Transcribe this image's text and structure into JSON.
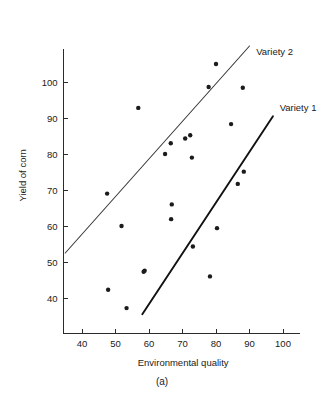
{
  "figure": {
    "panel_label": "(a)",
    "width": 325,
    "height": 397
  },
  "chart_data": {
    "type": "scatter",
    "title": "",
    "subtitle": "",
    "xlabel": "Environmental quality",
    "ylabel": "Yield of corn",
    "xlim": [
      34,
      104
    ],
    "ylim": [
      32,
      108
    ],
    "xticks": [
      40,
      50,
      60,
      70,
      80,
      90,
      100
    ],
    "xticklabels": [
      "40",
      "50",
      "60",
      "70",
      "80",
      "90",
      "100"
    ],
    "yticks": [
      40,
      50,
      60,
      70,
      80,
      90,
      100
    ],
    "yticklabels": [
      "40",
      "50",
      "60",
      "70",
      "80",
      "90",
      "100"
    ],
    "grid": false,
    "legend_position": "inline-right-of-lines",
    "annotations": [
      {
        "text": "Variety 2",
        "x": 92,
        "y": 107.5
      },
      {
        "text": "Variety 1",
        "x": 99,
        "y": 92.0
      }
    ],
    "points": [
      {
        "x": 47.5,
        "y": 69.0
      },
      {
        "x": 47.8,
        "y": 42.3
      },
      {
        "x": 51.8,
        "y": 60.0
      },
      {
        "x": 53.3,
        "y": 37.2
      },
      {
        "x": 56.8,
        "y": 92.8
      },
      {
        "x": 58.4,
        "y": 47.3
      },
      {
        "x": 58.7,
        "y": 47.6
      },
      {
        "x": 64.8,
        "y": 80.0
      },
      {
        "x": 66.5,
        "y": 83.0
      },
      {
        "x": 66.6,
        "y": 61.9
      },
      {
        "x": 66.8,
        "y": 66.0
      },
      {
        "x": 70.8,
        "y": 84.3
      },
      {
        "x": 72.3,
        "y": 85.2
      },
      {
        "x": 72.8,
        "y": 79.0
      },
      {
        "x": 73.1,
        "y": 54.3
      },
      {
        "x": 77.8,
        "y": 98.6
      },
      {
        "x": 78.2,
        "y": 46.0
      },
      {
        "x": 80.0,
        "y": 105.0
      },
      {
        "x": 80.3,
        "y": 59.4
      },
      {
        "x": 84.5,
        "y": 88.3
      },
      {
        "x": 86.5,
        "y": 71.7
      },
      {
        "x": 88.0,
        "y": 98.4
      },
      {
        "x": 88.3,
        "y": 75.1
      }
    ],
    "series": [
      {
        "name": "Variety 1",
        "type": "line",
        "x": [
          58.0,
          97.0
        ],
        "y": [
          35.5,
          90.5
        ]
      },
      {
        "name": "Variety 2",
        "type": "line",
        "x": [
          35.0,
          90.0
        ],
        "y": [
          52.5,
          110.0
        ]
      }
    ]
  }
}
